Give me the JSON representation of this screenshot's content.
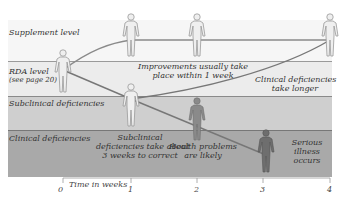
{
  "bands": [
    {
      "label": "Supplement level",
      "color": "#f6f6f6"
    },
    {
      "label": "RDA level",
      "sublabel": "(see page 20)",
      "color": "#ececec"
    },
    {
      "label": "Subclinical deficiencies",
      "color": "#cfcfcf"
    },
    {
      "label": "Clinical deficiencies",
      "color": "#a9a9a9"
    }
  ],
  "notes": {
    "improvements_1": "Improvements usually take",
    "improvements_2": "place within 1 week",
    "clinical_longer_1": "Clinical deficiencies",
    "clinical_longer_2": "take longer",
    "subclinical_correct_1": "Subclinical",
    "subclinical_correct_2": "deficiencies take about",
    "subclinical_correct_3": "3 weeks to correct",
    "health_problems_1": "Health problems",
    "health_problems_2": "are likely",
    "serious_illness_1": "Serious",
    "serious_illness_2": "illness",
    "serious_illness_3": "occurs"
  },
  "axis": {
    "title": "Time in weeks",
    "ticks": [
      "0",
      "1",
      "2",
      "3",
      "4"
    ]
  }
}
